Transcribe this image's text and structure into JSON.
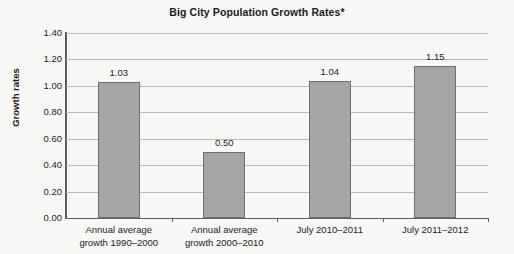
{
  "chart_data": {
    "type": "bar",
    "title": "Big City Population Growth Rates*",
    "xlabel": "",
    "ylabel": "Growth rates",
    "ylim": [
      0.0,
      1.4
    ],
    "ytick_step": 0.2,
    "grid": true,
    "legend": null,
    "categories": [
      "Annual average growth 1990–2000",
      "Annual average growth 2000–2010",
      "July 2010–2011",
      "July 2011–2012"
    ],
    "category_lines": [
      [
        "Annual average",
        "growth 1990–2000"
      ],
      [
        "Annual average",
        "growth 2000–2010"
      ],
      [
        "July 2010–2011",
        ""
      ],
      [
        "July 2011–2012",
        ""
      ]
    ],
    "values": [
      1.03,
      0.5,
      1.04,
      1.15
    ],
    "value_labels": [
      "1.03",
      "0.50",
      "1.04",
      "1.15"
    ],
    "ytick_labels": [
      "1.40",
      "1.20",
      "1.00",
      "0.80",
      "0.60",
      "0.40",
      "0.20",
      "0.00"
    ],
    "ytick_values": [
      1.4,
      1.2,
      1.0,
      0.8,
      0.6,
      0.4,
      0.2,
      0.0
    ],
    "colors": {
      "bar_fill": "#a6a6a6",
      "bar_border": "#6e6e6e",
      "gridline": "#b9b9b9",
      "axis": "#5d5d5d",
      "text": "#1b1b1b",
      "background": "#f7f7f5"
    }
  }
}
